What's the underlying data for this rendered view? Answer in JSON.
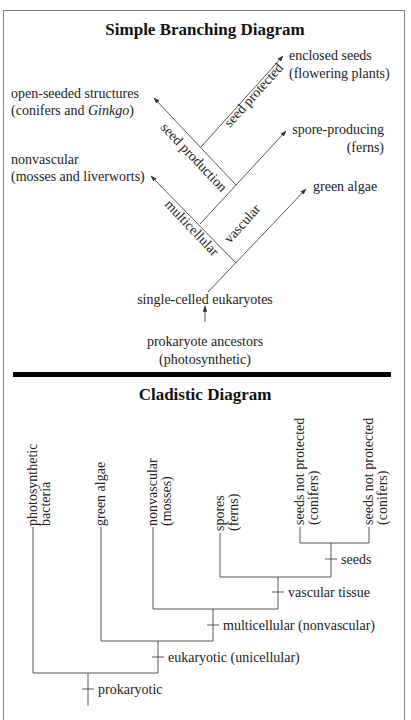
{
  "simple_diagram": {
    "title": "Simple Branching Diagram",
    "leaves": {
      "enclosed_seeds": [
        "enclosed seeds",
        "(flowering plants)"
      ],
      "open_seeded": [
        "open-seeded structures",
        "(conifers and ",
        "Ginkgo",
        ")"
      ],
      "spore_producing": [
        "spore-producing",
        "(ferns)"
      ],
      "nonvascular": [
        "nonvascular",
        "(mosses and liverworts)"
      ],
      "green_algae": "green algae",
      "single_celled": "single-celled eukaryotes",
      "prokaryote": [
        "prokaryote ancestors",
        "(photosynthetic)"
      ]
    },
    "branch_labels": {
      "seed_production": "seed production",
      "seed_protected": "seed protected",
      "vascular": "vascular",
      "multicellular": "multicellular"
    }
  },
  "cladistic_diagram": {
    "title": "Cladistic Diagram",
    "taxa": [
      [
        "photosynthetic",
        "bacteria"
      ],
      [
        "green algae"
      ],
      [
        "nonvascular",
        "(mosses)"
      ],
      [
        "spores",
        "(ferns)"
      ],
      [
        "seeds not protected",
        "(conifers)"
      ],
      [
        "seeds not protected",
        "(conifers)"
      ]
    ],
    "traits": {
      "seeds": "seeds",
      "vascular_tissue": "vascular tissue",
      "multicellular": "multicellular (nonvascular)",
      "eukaryotic": "eukaryotic (unicellular)",
      "prokaryotic": "prokaryotic"
    }
  }
}
